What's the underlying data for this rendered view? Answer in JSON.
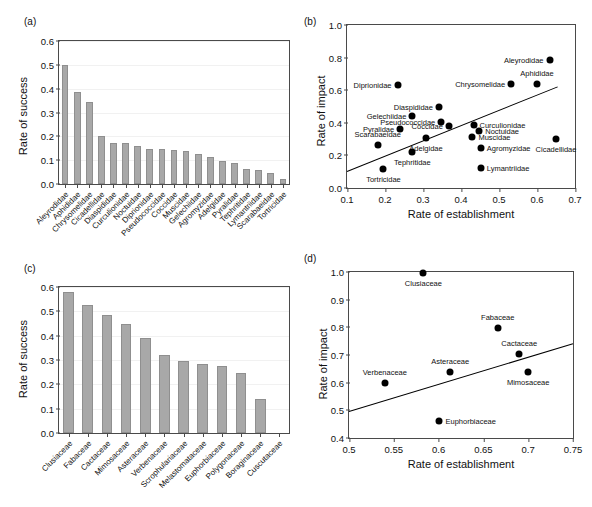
{
  "figure": {
    "panels": [
      "(a)",
      "(b)",
      "(c)",
      "(d)"
    ]
  },
  "chart_data": [
    {
      "panel": "(a)",
      "type": "bar",
      "title": "",
      "xlabel": "",
      "ylabel": "Rate of success",
      "ylim": [
        0.0,
        0.6
      ],
      "yticks": [
        "0.0",
        "0.1",
        "0.2",
        "0.3",
        "0.4",
        "0.5",
        "0.6"
      ],
      "grid": true,
      "categories": [
        "Aleyrodidae",
        "Aphididae",
        "Chrysomelidae",
        "Cicadellidae",
        "Diaspididae",
        "Curculionidae",
        "Noctuidae",
        "Diprionidae",
        "Pseudococcidae",
        "Coccidae",
        "Muscidae",
        "Gelechiidae",
        "Agromyzidae",
        "Adelgidae",
        "Pyralidae",
        "Tephritidae",
        "Lymantriidae",
        "Scarabaeidae",
        "Tortricidae"
      ],
      "values": [
        0.5,
        0.385,
        0.345,
        0.2,
        0.172,
        0.17,
        0.161,
        0.148,
        0.145,
        0.143,
        0.137,
        0.125,
        0.112,
        0.095,
        0.089,
        0.061,
        0.057,
        0.048,
        0.022
      ]
    },
    {
      "panel": "(b)",
      "type": "scatter",
      "title": "",
      "xlabel": "Rate of establishment",
      "ylabel": "Rate of impact",
      "xlim": [
        0.1,
        0.7
      ],
      "ylim": [
        0.0,
        1.0
      ],
      "xticks": [
        "0.1",
        "0.2",
        "0.3",
        "0.4",
        "0.5",
        "0.6",
        "0.7"
      ],
      "yticks": [
        "0.0",
        "0.2",
        "0.4",
        "0.6",
        "0.8",
        "1.0"
      ],
      "grid": false,
      "trendline": {
        "x1": 0.1,
        "y1": 0.105,
        "x2": 0.655,
        "y2": 0.625
      },
      "points": [
        {
          "label": "Aleyrodidae",
          "x": 0.633,
          "y": 0.787,
          "pos": "left"
        },
        {
          "label": "Aphididae",
          "x": 0.6,
          "y": 0.636,
          "pos": "above"
        },
        {
          "label": "Chrysomelidae",
          "x": 0.532,
          "y": 0.641,
          "pos": "left"
        },
        {
          "label": "Diprionidae",
          "x": 0.233,
          "y": 0.634,
          "pos": "left"
        },
        {
          "label": "Diaspididae",
          "x": 0.342,
          "y": 0.5,
          "pos": "left"
        },
        {
          "label": "Gelechiidae",
          "x": 0.272,
          "y": 0.443,
          "pos": "left"
        },
        {
          "label": "Pseudococcidae",
          "x": 0.348,
          "y": 0.405,
          "pos": "left"
        },
        {
          "label": "Coccidae",
          "x": 0.368,
          "y": 0.382,
          "pos": "left"
        },
        {
          "label": "Curculionidae",
          "x": 0.433,
          "y": 0.388,
          "pos": "right"
        },
        {
          "label": "Noctuidae",
          "x": 0.448,
          "y": 0.352,
          "pos": "right"
        },
        {
          "label": "Pyralidae",
          "x": 0.24,
          "y": 0.362,
          "pos": "left"
        },
        {
          "label": "Muscidae",
          "x": 0.43,
          "y": 0.313,
          "pos": "right"
        },
        {
          "label": "Adelgidae",
          "x": 0.308,
          "y": 0.305,
          "pos": "below"
        },
        {
          "label": "Scarabaeidae",
          "x": 0.181,
          "y": 0.266,
          "pos": "above"
        },
        {
          "label": "Agromyzidae",
          "x": 0.452,
          "y": 0.245,
          "pos": "right"
        },
        {
          "label": "Cicadellidae",
          "x": 0.65,
          "y": 0.303,
          "pos": "below"
        },
        {
          "label": "Tephritidae",
          "x": 0.272,
          "y": 0.223,
          "pos": "below"
        },
        {
          "label": "Tortricidae",
          "x": 0.196,
          "y": 0.119,
          "pos": "below"
        },
        {
          "label": "Lymantriidae",
          "x": 0.452,
          "y": 0.122,
          "pos": "right"
        }
      ]
    },
    {
      "panel": "(c)",
      "type": "bar",
      "title": "",
      "xlabel": "",
      "ylabel": "Rate of success",
      "ylim": [
        0.0,
        0.6
      ],
      "yticks": [
        "0.0",
        "0.1",
        "0.2",
        "0.3",
        "0.4",
        "0.5",
        "0.6"
      ],
      "grid": true,
      "categories": [
        "Clusiaceae",
        "Fabaceae",
        "Cactaceae",
        "Mimosaceae",
        "Asteraceae",
        "Verbenaceae",
        "Scrophulariaceae",
        "Melastomataceae",
        "Euphorbiaceae",
        "Polygonaceae",
        "Boraginaceae",
        "Cuscutaceae"
      ],
      "values": [
        0.578,
        0.528,
        0.483,
        0.446,
        0.392,
        0.32,
        0.296,
        0.283,
        0.275,
        0.247,
        0.14,
        0.0
      ]
    },
    {
      "panel": "(d)",
      "type": "scatter",
      "title": "",
      "xlabel": "Rate of establishment",
      "ylabel": "Rate of impact",
      "xlim": [
        0.5,
        0.75
      ],
      "ylim": [
        0.4,
        1.0
      ],
      "xticks": [
        "0.5",
        "0.55",
        "0.6",
        "0.65",
        "0.7",
        "0.75"
      ],
      "yticks": [
        "0.4",
        "0.5",
        "0.6",
        "0.7",
        "0.8",
        "0.9",
        "1.0"
      ],
      "grid": false,
      "trendline": {
        "x1": 0.5,
        "y1": 0.497,
        "x2": 0.75,
        "y2": 0.742
      },
      "points": [
        {
          "label": "Clusiaceae",
          "x": 0.583,
          "y": 0.998,
          "pos": "below"
        },
        {
          "label": "Fabaceae",
          "x": 0.666,
          "y": 0.797,
          "pos": "above"
        },
        {
          "label": "Cactaceae",
          "x": 0.69,
          "y": 0.702,
          "pos": "above"
        },
        {
          "label": "Asteraceae",
          "x": 0.613,
          "y": 0.64,
          "pos": "above"
        },
        {
          "label": "Mimosaceae",
          "x": 0.7,
          "y": 0.639,
          "pos": "below"
        },
        {
          "label": "Verbenaceae",
          "x": 0.54,
          "y": 0.597,
          "pos": "above"
        },
        {
          "label": "Euphorbiaceae",
          "x": 0.601,
          "y": 0.463,
          "pos": "right"
        }
      ]
    }
  ]
}
